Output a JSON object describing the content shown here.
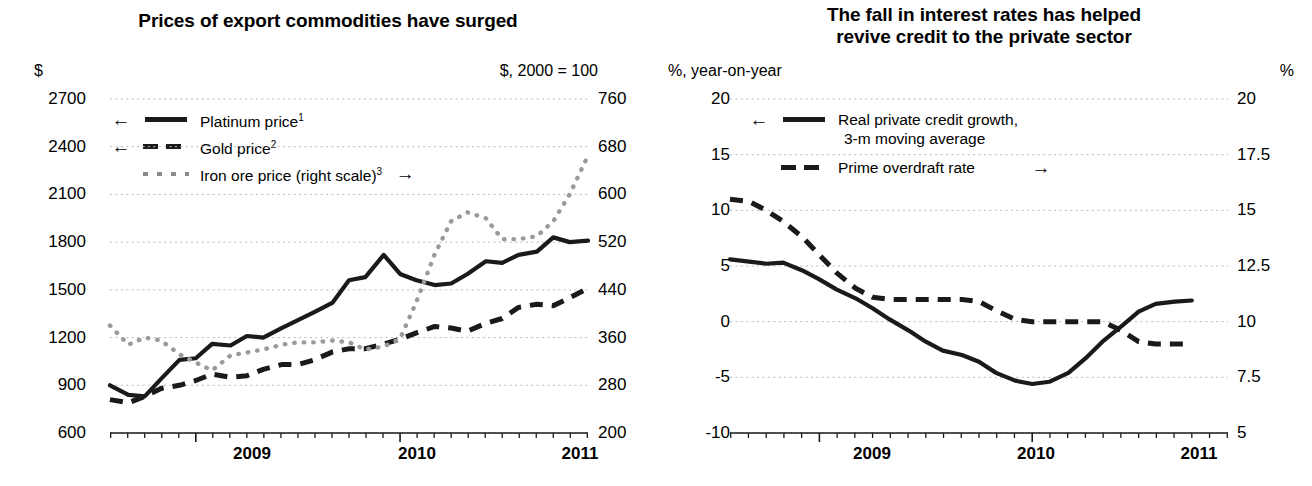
{
  "panels": [
    {
      "id": "commodity-prices",
      "title": "Prices of export commodities have surged",
      "unit_left": "$",
      "unit_right": "$, 2000 = 100",
      "legend": [
        {
          "arrow": "←",
          "arrow_side": "left",
          "style": "solid",
          "label": "Platinum price",
          "sup": "1"
        },
        {
          "arrow": "←",
          "arrow_side": "left",
          "style": "dash",
          "label": "Gold price",
          "sup": "2"
        },
        {
          "arrow": "→",
          "arrow_side": "right",
          "style": "dot",
          "label": "Iron ore price (right scale)",
          "sup": "3"
        }
      ]
    },
    {
      "id": "interest-rates-credit",
      "title_line1": "The fall in interest rates has helped",
      "title_line2": "revive credit to the private sector",
      "unit_left": "%, year-on-year",
      "unit_right": "%",
      "legend": [
        {
          "arrow": "←",
          "arrow_side": "left",
          "style": "solid",
          "label": "Real private credit growth,",
          "label2": "3-m moving average"
        },
        {
          "arrow": "→",
          "arrow_side": "right",
          "style": "dash",
          "label": "Prime overdraft rate"
        }
      ]
    }
  ],
  "chart_data": [
    {
      "type": "line",
      "title": "Prices of export commodities have surged",
      "xlabel": "",
      "ylabel": "$",
      "ylabel_right": "$, 2000 = 100",
      "grid": true,
      "legend_position": "inside-top-left",
      "xlim": [
        2008.58,
        2010.92
      ],
      "xticks_major": [
        2009.0,
        2010.0,
        2011.0
      ],
      "xtick_labels": [
        "2009",
        "2010",
        "2011"
      ],
      "ylim": [
        600,
        2700
      ],
      "yticks": [
        600,
        900,
        1200,
        1500,
        1800,
        2100,
        2400,
        2700
      ],
      "ylim_right": [
        200,
        760
      ],
      "yticks_right": [
        200,
        280,
        360,
        440,
        520,
        600,
        680,
        760
      ],
      "x": [
        2008.58,
        2008.67,
        2008.75,
        2008.83,
        2008.92,
        2009.0,
        2009.08,
        2009.17,
        2009.25,
        2009.33,
        2009.42,
        2009.5,
        2009.58,
        2009.67,
        2009.75,
        2009.83,
        2009.92,
        2010.0,
        2010.08,
        2010.17,
        2010.25,
        2010.33,
        2010.42,
        2010.5,
        2010.58,
        2010.67,
        2010.75,
        2010.83,
        2010.92
      ],
      "series": [
        {
          "name": "Platinum price",
          "axis": "left",
          "style": "solid",
          "units": "$",
          "values": [
            900,
            840,
            830,
            940,
            1060,
            1070,
            1160,
            1150,
            1210,
            1200,
            1260,
            1310,
            1360,
            1420,
            1560,
            1580,
            1720,
            1600,
            1560,
            1530,
            1540,
            1600,
            1680,
            1670,
            1720,
            1740,
            1830,
            1800,
            1810
          ]
        },
        {
          "name": "Gold price",
          "axis": "left",
          "style": "dash",
          "units": "$",
          "values": [
            810,
            790,
            830,
            880,
            900,
            930,
            970,
            950,
            960,
            1000,
            1030,
            1030,
            1060,
            1110,
            1130,
            1130,
            1160,
            1190,
            1230,
            1270,
            1260,
            1240,
            1290,
            1320,
            1390,
            1410,
            1400,
            1450,
            1510
          ]
        },
        {
          "name": "Iron ore price (right scale)",
          "axis": "right",
          "style": "dot",
          "units": "index 2000=100",
          "values": [
            380,
            348,
            360,
            355,
            332,
            318,
            305,
            330,
            335,
            340,
            348,
            352,
            352,
            355,
            352,
            340,
            345,
            358,
            420,
            500,
            555,
            570,
            560,
            525,
            525,
            530,
            555,
            600,
            665
          ]
        }
      ]
    },
    {
      "type": "line",
      "title": "The fall in interest rates has helped revive credit to the private sector",
      "xlabel": "",
      "ylabel": "%, year-on-year",
      "ylabel_right": "%",
      "grid": true,
      "legend_position": "inside-top-left",
      "xlim": [
        2008.58,
        2010.92
      ],
      "xticks_major": [
        2009.0,
        2010.0,
        2011.0
      ],
      "xtick_labels": [
        "2009",
        "2010",
        "2011"
      ],
      "ylim": [
        -10,
        20
      ],
      "yticks": [
        -10,
        -5,
        0,
        5,
        10,
        15,
        20
      ],
      "ylim_right": [
        5.0,
        20.0
      ],
      "yticks_right": [
        5.0,
        7.5,
        10.0,
        12.5,
        15.0,
        17.5,
        20.0
      ],
      "x": [
        2008.58,
        2008.67,
        2008.75,
        2008.83,
        2008.92,
        2009.0,
        2009.08,
        2009.17,
        2009.25,
        2009.33,
        2009.42,
        2009.5,
        2009.58,
        2009.67,
        2009.75,
        2009.83,
        2009.92,
        2010.0,
        2010.08,
        2010.17,
        2010.25,
        2010.33,
        2010.42,
        2010.5,
        2010.58,
        2010.67,
        2010.75
      ],
      "series": [
        {
          "name": "Real private credit growth, 3-m moving average",
          "axis": "left",
          "style": "solid",
          "units": "% y/y",
          "values": [
            5.6,
            5.4,
            5.2,
            5.3,
            4.6,
            3.8,
            2.9,
            2.1,
            1.2,
            0.2,
            -0.8,
            -1.8,
            -2.6,
            -3.0,
            -3.6,
            -4.6,
            -5.3,
            -5.6,
            -5.4,
            -4.6,
            -3.3,
            -1.8,
            -0.4,
            0.9,
            1.6,
            1.8,
            1.9
          ]
        },
        {
          "name": "Prime overdraft rate",
          "axis": "right",
          "style": "dash",
          "units": "%",
          "values": [
            15.5,
            15.4,
            15.0,
            14.5,
            13.8,
            13.0,
            12.2,
            11.5,
            11.1,
            11.0,
            11.0,
            11.0,
            11.0,
            11.0,
            10.9,
            10.5,
            10.1,
            10.0,
            10.0,
            10.0,
            10.0,
            10.0,
            9.6,
            9.1,
            9.0,
            9.0,
            9.0
          ]
        }
      ]
    }
  ]
}
